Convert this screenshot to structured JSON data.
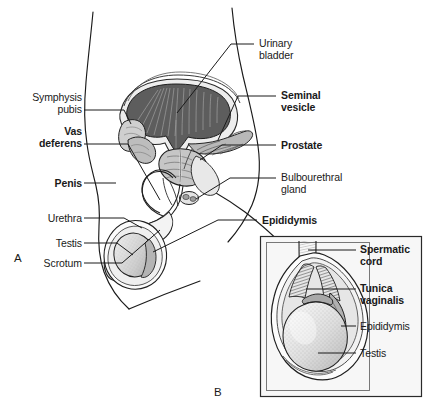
{
  "figure": {
    "panels": [
      {
        "letter": "A",
        "x": 14,
        "y": 252
      },
      {
        "letter": "B",
        "x": 214,
        "y": 386
      }
    ],
    "left_labels": [
      {
        "name": "symphysis-pubis",
        "lines": [
          "Symphysis",
          "pubis"
        ],
        "bold": false,
        "right": 343,
        "top": 92,
        "leader": {
          "x1": 84,
          "y1": 110,
          "x2": 124,
          "y2": 110
        }
      },
      {
        "name": "vas-deferens",
        "lines": [
          "Vas",
          "deferens"
        ],
        "bold": true,
        "right": 343,
        "top": 126,
        "leader": {
          "x1": 84,
          "y1": 144,
          "x2": 128,
          "y2": 144
        }
      },
      {
        "name": "penis",
        "lines": [
          "Penis"
        ],
        "bold": true,
        "right": 343,
        "top": 178,
        "leader": {
          "x1": 84,
          "y1": 183,
          "x2": 116,
          "y2": 183
        }
      },
      {
        "name": "urethra",
        "lines": [
          "Urethra"
        ],
        "bold": false,
        "right": 343,
        "top": 213,
        "leader": {
          "x1": 84,
          "y1": 218,
          "x2": 124,
          "y2": 218
        }
      },
      {
        "name": "testis",
        "lines": [
          "Testis"
        ],
        "bold": false,
        "right": 343,
        "top": 238,
        "leader": {
          "x1": 84,
          "y1": 243,
          "x2": 117,
          "y2": 243
        }
      },
      {
        "name": "scrotum",
        "lines": [
          "Scrotum"
        ],
        "bold": false,
        "right": 343,
        "top": 258,
        "leader": {
          "x1": 84,
          "y1": 263,
          "x2": 122,
          "y2": 263
        }
      }
    ],
    "right_labels": [
      {
        "name": "urinary-bladder",
        "lines": [
          "Urinary",
          "bladder"
        ],
        "bold": false,
        "left": 259,
        "top": 38,
        "leader": {
          "x1": 231,
          "y1": 44,
          "x2": 254,
          "y2": 44
        }
      },
      {
        "name": "seminal-vesicle",
        "lines": [
          "Seminal",
          "vesicle"
        ],
        "bold": true,
        "left": 281,
        "top": 90,
        "leader": {
          "x1": 238,
          "y1": 96,
          "x2": 276,
          "y2": 96
        }
      },
      {
        "name": "prostate",
        "lines": [
          "Prostate"
        ],
        "bold": true,
        "left": 281,
        "top": 140,
        "leader": {
          "x1": 222,
          "y1": 145,
          "x2": 276,
          "y2": 145
        }
      },
      {
        "name": "bulbourethral-gland",
        "lines": [
          "Bulbourethral",
          "gland"
        ],
        "bold": false,
        "left": 281,
        "top": 172,
        "leader": {
          "x1": 230,
          "y1": 178,
          "x2": 276,
          "y2": 178
        }
      },
      {
        "name": "epididymis",
        "lines": [
          "Epididymis"
        ],
        "bold": true,
        "left": 262,
        "top": 215,
        "leader": {
          "x1": 218,
          "y1": 220,
          "x2": 257,
          "y2": 220
        }
      }
    ],
    "inset": {
      "name": "scrotum-detail-inset",
      "box": {
        "x": 260,
        "y": 236,
        "width": 162,
        "height": 161
      },
      "labels": [
        {
          "name": "spermatic-cord",
          "lines": [
            "Spermatic",
            "cord"
          ],
          "bold": true,
          "left": 360,
          "top": 244,
          "leader": {
            "x1": 318,
            "y1": 250,
            "x2": 356,
            "y2": 250
          }
        },
        {
          "name": "tunica-vaginalis",
          "lines": [
            "Tunica",
            "vaginalis"
          ],
          "bold": true,
          "left": 360,
          "top": 283,
          "leader": {
            "x1": 306,
            "y1": 289,
            "x2": 356,
            "y2": 289
          }
        },
        {
          "name": "epididymis",
          "lines": [
            "Epididymis"
          ],
          "bold": false,
          "left": 360,
          "top": 321,
          "leader": {
            "x1": 330,
            "y1": 326,
            "x2": 356,
            "y2": 326
          }
        },
        {
          "name": "testis",
          "lines": [
            "Testis"
          ],
          "bold": false,
          "left": 360,
          "top": 348,
          "leader": {
            "x1": 318,
            "y1": 353,
            "x2": 356,
            "y2": 353
          }
        }
      ]
    },
    "colors": {
      "line": "#1a1a1a",
      "leader": "#1a1a1a",
      "text": "#1a1a1a",
      "bladder_fill": "#585858",
      "organ_light": "#d8d8d8",
      "organ_mid": "#a8a8a8",
      "organ_dark": "#6e6e6e",
      "inset_bg": "#f7f7f7",
      "inset_border": "#2a2a2a",
      "background": "#ffffff"
    }
  }
}
